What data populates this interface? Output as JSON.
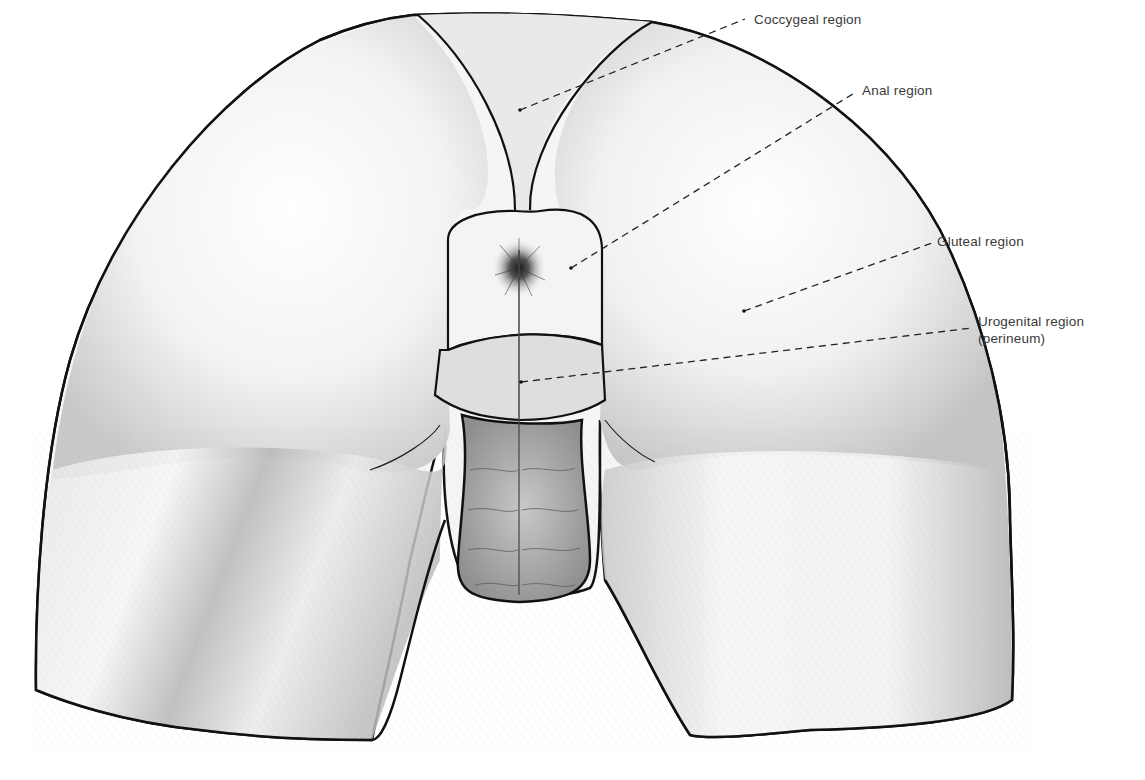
{
  "figure": {
    "colors": {
      "outline": "#111111",
      "shading": "#9a9a9a",
      "leader": "#222222",
      "label_text": "#3a3a3a",
      "background": "#ffffff"
    }
  },
  "labels": [
    {
      "id": "coccygeal",
      "text": "Coccygeal region",
      "line2": "",
      "x": 754,
      "y": 11,
      "target": [
        520,
        110
      ],
      "anchor": [
        745,
        19
      ]
    },
    {
      "id": "anal",
      "text": "Anal region",
      "line2": "",
      "x": 862,
      "y": 82,
      "target": [
        571,
        268
      ],
      "anchor": [
        856,
        92
      ]
    },
    {
      "id": "gluteal",
      "text": "Gluteal region",
      "line2": "",
      "x": 937,
      "y": 233,
      "target": [
        744,
        311
      ],
      "anchor": [
        932,
        243
      ]
    },
    {
      "id": "urogenital",
      "text": "Urogenital region",
      "line2": "(perineum)",
      "x": 978,
      "y": 313,
      "target": [
        521,
        382
      ],
      "anchor": [
        972,
        328
      ]
    }
  ]
}
